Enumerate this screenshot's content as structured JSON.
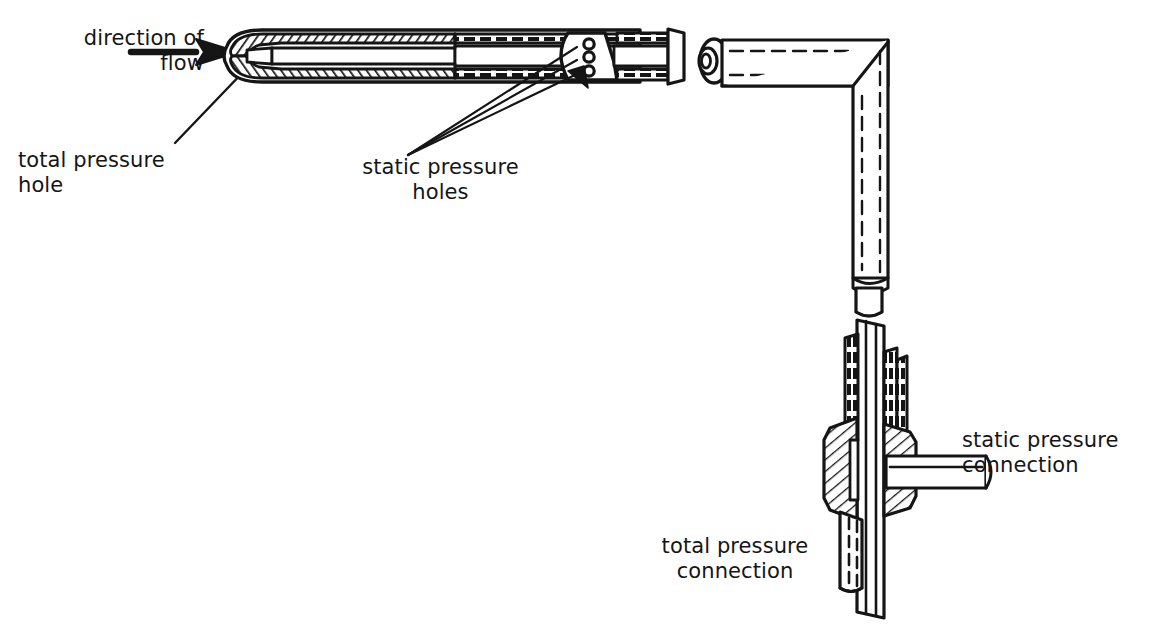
{
  "figure": {
    "type": "technical-line-drawing",
    "background_color": "#ffffff",
    "ink_color": "#151515",
    "canvas": {
      "width": 1155,
      "height": 630
    }
  },
  "labels": {
    "direction_of_flow": "direction of\nflow",
    "total_pressure_hole": "total pressure\nhole",
    "static_pressure_holes": "static pressure\nholes",
    "static_pressure_connection": "static pressure\nconnection",
    "total_pressure_connection": "total pressure\nconnection"
  },
  "annotations": {
    "flow_arrow": "flow-direction-arrow",
    "total_pressure_leader": "leader-line-to-probe-tip",
    "static_pressure_leaders": "three-leader-lines-to-static-holes"
  },
  "components": {
    "probe_tip": "rounded-nose-sectioned",
    "probe_body": "hatched-double-wall-tube",
    "inner_tube": "total-pressure-inner-tube",
    "static_holes_count": 3,
    "break_gap": "drawing-break",
    "coupling_collar": "socket-collar",
    "elbow": "ninety-degree-mitered-bend",
    "vertical_stem": "vertical-tube-with-hidden-lines",
    "mounting_plate": "flat-mounting-plate",
    "hex_fitting": "hatched-union-fitting",
    "side_connection": "horizontal-static-pressure-port",
    "bottom_stub": "total-pressure-outlet-stub"
  }
}
